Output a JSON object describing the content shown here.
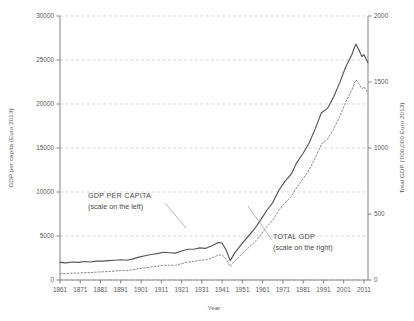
{
  "chart_data": {
    "type": "line",
    "title": "",
    "xlabel": "Year",
    "ylabel": "GDP per capita (Euro 2013)",
    "y2label": "Total GDP ('000,000 Euro 2013)",
    "xlim": [
      1861,
      2013
    ],
    "ylim": [
      0,
      30000
    ],
    "y2lim": [
      0,
      2000
    ],
    "grid": true,
    "legend_position": "inline-annotations",
    "xticks": [
      1861,
      1871,
      1881,
      1891,
      1901,
      1911,
      1921,
      1931,
      1941,
      1951,
      1961,
      1971,
      1981,
      1991,
      2001,
      2011
    ],
    "yticks": [
      0,
      5000,
      10000,
      15000,
      20000,
      25000,
      30000
    ],
    "y2ticks": [
      0,
      500,
      1000,
      1500,
      2000
    ],
    "annotations": [
      {
        "name": "gdp-per-capita-annotation",
        "line1": "GDP PER CAPITA",
        "line2": "(scale on the left)"
      },
      {
        "name": "total-gdp-annotation",
        "line1": "TOTAL GDP",
        "line2": "(scale on the right)"
      }
    ],
    "series": [
      {
        "name": "GDP per capita",
        "axis": "left",
        "style": "solid",
        "color": "#555555",
        "x": [
          1861,
          1864,
          1867,
          1870,
          1873,
          1876,
          1879,
          1882,
          1885,
          1888,
          1891,
          1894,
          1897,
          1900,
          1903,
          1906,
          1909,
          1912,
          1915,
          1918,
          1921,
          1924,
          1927,
          1930,
          1933,
          1936,
          1939,
          1941,
          1943,
          1945,
          1947,
          1949,
          1951,
          1954,
          1957,
          1960,
          1963,
          1966,
          1969,
          1972,
          1975,
          1978,
          1981,
          1984,
          1987,
          1990,
          1993,
          1996,
          1999,
          2002,
          2005,
          2007,
          2008,
          2010,
          2011,
          2013
        ],
        "values": [
          2000,
          1950,
          2050,
          2000,
          2100,
          2050,
          2150,
          2150,
          2200,
          2250,
          2300,
          2250,
          2400,
          2600,
          2750,
          2900,
          3000,
          3150,
          3100,
          3050,
          3300,
          3500,
          3500,
          3650,
          3600,
          3900,
          4250,
          4200,
          3400,
          2200,
          3000,
          3600,
          4200,
          5000,
          5800,
          6800,
          7900,
          8800,
          10200,
          11200,
          12000,
          13400,
          14400,
          15600,
          17200,
          19000,
          19500,
          20800,
          22400,
          24200,
          25600,
          26800,
          26400,
          25400,
          25600,
          24700
        ]
      },
      {
        "name": "Total GDP",
        "axis": "right",
        "style": "dotted",
        "color": "#8a8a8a",
        "x": [
          1861,
          1864,
          1867,
          1870,
          1873,
          1876,
          1879,
          1882,
          1885,
          1888,
          1891,
          1894,
          1897,
          1900,
          1903,
          1906,
          1909,
          1912,
          1915,
          1918,
          1921,
          1924,
          1927,
          1930,
          1933,
          1936,
          1939,
          1941,
          1943,
          1945,
          1947,
          1949,
          1951,
          1954,
          1957,
          1960,
          1963,
          1966,
          1969,
          1972,
          1975,
          1978,
          1981,
          1984,
          1987,
          1990,
          1993,
          1996,
          1999,
          2002,
          2005,
          2007,
          2008,
          2010,
          2011,
          2013
        ],
        "values": [
          48,
          48,
          52,
          52,
          56,
          56,
          60,
          62,
          64,
          68,
          72,
          72,
          78,
          86,
          92,
          98,
          104,
          112,
          112,
          112,
          124,
          136,
          140,
          150,
          152,
          168,
          188,
          190,
          156,
          104,
          140,
          170,
          202,
          244,
          286,
          340,
          402,
          452,
          528,
          582,
          630,
          706,
          768,
          836,
          926,
          1030,
          1066,
          1142,
          1236,
          1348,
          1438,
          1516,
          1500,
          1448,
          1464,
          1414
        ]
      }
    ]
  }
}
